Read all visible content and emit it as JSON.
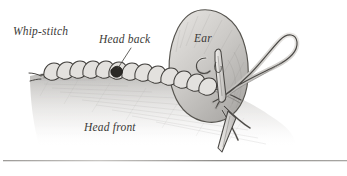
{
  "figure": {
    "medium": "pencil-illustration",
    "background_color": "#ffffff",
    "ink_color": "#3b3a38",
    "shading_color": "#b9b7b4"
  },
  "labels": {
    "whip_stitch": "Whip-stitch",
    "head_back": "Head back",
    "ear": "Ear",
    "head_front": "Head front"
  },
  "elements": {
    "leader_line": "head-back-leader-line",
    "seam": "whip-stitch-seam",
    "ear_shape": "ear-piece",
    "needle": "sewing-needle",
    "thread_loop": "thread-loop",
    "fabric": "head-front-fabric",
    "rule": "bottom-divider-rule"
  }
}
